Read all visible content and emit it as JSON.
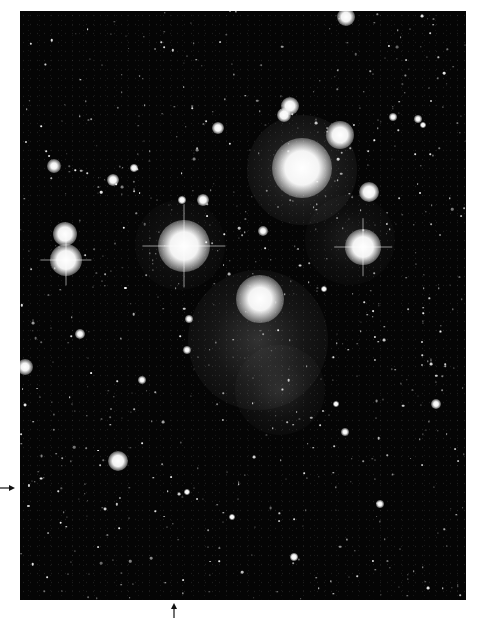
{
  "photo": {
    "subject": "Pleiades star cluster",
    "frame": {
      "left": 20,
      "top": 11,
      "width": 446,
      "height": 589
    },
    "background_color": "#050505",
    "border_color": "#ffffff"
  },
  "markers": [
    {
      "name": "left-arrow-marker",
      "direction": "right",
      "x": 0,
      "y": 488,
      "length": 14
    },
    {
      "name": "bottom-arrow-marker",
      "direction": "up",
      "x": 174,
      "y": 603,
      "length": 14
    }
  ],
  "nebulae": [
    {
      "x": 302,
      "y": 170,
      "r": 55,
      "opacity": 0.28
    },
    {
      "x": 258,
      "y": 340,
      "r": 70,
      "opacity": 0.22
    },
    {
      "x": 280,
      "y": 390,
      "r": 45,
      "opacity": 0.15
    },
    {
      "x": 350,
      "y": 240,
      "r": 45,
      "opacity": 0.12
    },
    {
      "x": 180,
      "y": 245,
      "r": 45,
      "opacity": 0.12
    }
  ],
  "stars": [
    {
      "x": 302,
      "y": 168,
      "r": 22,
      "glow": 30,
      "spikes": false
    },
    {
      "x": 184,
      "y": 246,
      "r": 18,
      "glow": 26,
      "spikes": true
    },
    {
      "x": 363,
      "y": 247,
      "r": 13,
      "glow": 18,
      "spikes": true
    },
    {
      "x": 260,
      "y": 299,
      "r": 15,
      "glow": 24,
      "spikes": false
    },
    {
      "x": 340,
      "y": 135,
      "r": 10,
      "glow": 14,
      "spikes": false
    },
    {
      "x": 66,
      "y": 260,
      "r": 12,
      "glow": 16,
      "spikes": true
    },
    {
      "x": 65,
      "y": 234,
      "r": 9,
      "glow": 12,
      "spikes": false
    },
    {
      "x": 369,
      "y": 192,
      "r": 7,
      "glow": 10,
      "spikes": false
    },
    {
      "x": 290,
      "y": 106,
      "r": 6,
      "glow": 9,
      "spikes": false
    },
    {
      "x": 284,
      "y": 115,
      "r": 5,
      "glow": 7,
      "spikes": false
    },
    {
      "x": 346,
      "y": 17,
      "r": 6,
      "glow": 9,
      "spikes": false
    },
    {
      "x": 118,
      "y": 461,
      "r": 7,
      "glow": 10,
      "spikes": false
    },
    {
      "x": 25,
      "y": 367,
      "r": 5,
      "glow": 8,
      "spikes": false
    },
    {
      "x": 54,
      "y": 166,
      "r": 4,
      "glow": 7,
      "spikes": false
    },
    {
      "x": 113,
      "y": 180,
      "r": 4,
      "glow": 6,
      "spikes": false
    },
    {
      "x": 203,
      "y": 200,
      "r": 4,
      "glow": 6,
      "spikes": false
    },
    {
      "x": 218,
      "y": 128,
      "r": 4,
      "glow": 6,
      "spikes": false
    },
    {
      "x": 8,
      "y": 336,
      "r": 3,
      "glow": 5,
      "spikes": false
    },
    {
      "x": 80,
      "y": 334,
      "r": 3,
      "glow": 5,
      "spikes": false
    },
    {
      "x": 263,
      "y": 231,
      "r": 3,
      "glow": 5,
      "spikes": false
    },
    {
      "x": 436,
      "y": 404,
      "r": 3,
      "glow": 5,
      "spikes": false
    },
    {
      "x": 134,
      "y": 168,
      "r": 3,
      "glow": 4,
      "spikes": false
    },
    {
      "x": 182,
      "y": 200,
      "r": 3,
      "glow": 4,
      "spikes": false
    },
    {
      "x": 294,
      "y": 557,
      "r": 3,
      "glow": 4,
      "spikes": false
    },
    {
      "x": 142,
      "y": 380,
      "r": 2.5,
      "glow": 4,
      "spikes": false
    },
    {
      "x": 187,
      "y": 350,
      "r": 2.5,
      "glow": 4,
      "spikes": false
    },
    {
      "x": 189,
      "y": 319,
      "r": 2.5,
      "glow": 4,
      "spikes": false
    },
    {
      "x": 345,
      "y": 432,
      "r": 2.5,
      "glow": 4,
      "spikes": false
    },
    {
      "x": 380,
      "y": 504,
      "r": 2.5,
      "glow": 4,
      "spikes": false
    },
    {
      "x": 393,
      "y": 117,
      "r": 2.5,
      "glow": 4,
      "spikes": false
    },
    {
      "x": 418,
      "y": 119,
      "r": 2.5,
      "glow": 4,
      "spikes": false
    },
    {
      "x": 423,
      "y": 125,
      "r": 2,
      "glow": 3,
      "spikes": false
    },
    {
      "x": 324,
      "y": 289,
      "r": 2,
      "glow": 3,
      "spikes": false
    },
    {
      "x": 336,
      "y": 404,
      "r": 2,
      "glow": 3,
      "spikes": false
    },
    {
      "x": 232,
      "y": 517,
      "r": 2,
      "glow": 3,
      "spikes": false
    },
    {
      "x": 187,
      "y": 492,
      "r": 2,
      "glow": 3,
      "spikes": false
    }
  ],
  "faint_star_seed": 1337,
  "faint_star_count": 650
}
